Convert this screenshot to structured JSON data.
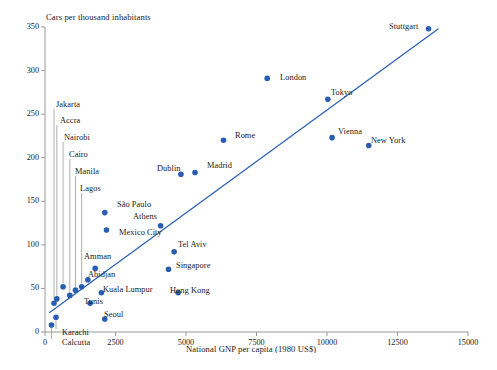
{
  "chart_data": {
    "type": "scatter",
    "title": "",
    "ylabel": "Cars per thousand inhabitants",
    "xlabel": "National GNP per capita (1980 US$)",
    "xlim": [
      0,
      15000
    ],
    "ylim": [
      0,
      350
    ],
    "xticks": [
      0,
      2500,
      5000,
      7500,
      10000,
      12500,
      15000
    ],
    "yticks": [
      0,
      50,
      100,
      150,
      200,
      250,
      300,
      350
    ],
    "grid": false,
    "legend": "none",
    "marker_color": "#2a5db0",
    "trendline_color": "#2a5db0",
    "axis_color": "#999999",
    "leader_color": "#999999",
    "trendline": {
      "x_start": 150,
      "y_start": 22,
      "x_end": 13950,
      "y_end": 348
    },
    "points": [
      {
        "city": "Calcutta",
        "x": 230,
        "y": 8,
        "label_pos": "leader-down",
        "label_x": 62,
        "label_y": 338
      },
      {
        "city": "Karachi",
        "x": 390,
        "y": 17,
        "label_pos": "leader-down",
        "label_x": 62,
        "label_y": 328
      },
      {
        "city": "Jakarta",
        "x": 320,
        "y": 33,
        "label_pos": "leader-up",
        "label_x": 56,
        "label_y": 100
      },
      {
        "city": "Accra",
        "x": 420,
        "y": 38,
        "label_pos": "leader-up",
        "label_x": 60,
        "label_y": 116
      },
      {
        "city": "Nairobi",
        "x": 640,
        "y": 52,
        "label_pos": "leader-up",
        "label_x": 64,
        "label_y": 133
      },
      {
        "city": "Cairo",
        "x": 880,
        "y": 42,
        "label_pos": "leader-up",
        "label_x": 69,
        "label_y": 150
      },
      {
        "city": "Manila",
        "x": 1080,
        "y": 48,
        "label_pos": "leader-up",
        "label_x": 75,
        "label_y": 167
      },
      {
        "city": "Lagos",
        "x": 1300,
        "y": 52,
        "label_pos": "leader-up",
        "label_x": 80,
        "label_y": 184
      },
      {
        "city": "Abidjan",
        "x": 1520,
        "y": 60,
        "label_pos": "right",
        "label_x": 88,
        "label_y": 270
      },
      {
        "city": "Amman",
        "x": 1780,
        "y": 73,
        "label_pos": "left",
        "label_x": 84,
        "label_y": 252
      },
      {
        "city": "Tunis",
        "x": 1600,
        "y": 33,
        "label_pos": "right",
        "label_x": 84,
        "label_y": 297
      },
      {
        "city": "Kuala Lumpur",
        "x": 2000,
        "y": 45,
        "label_pos": "right",
        "label_x": 103,
        "label_y": 285
      },
      {
        "city": "Seoul",
        "x": 2120,
        "y": 15,
        "label_pos": "right",
        "label_x": 104,
        "label_y": 310
      },
      {
        "city": "Mexico City",
        "x": 2180,
        "y": 117,
        "label_pos": "below",
        "label_x": 119,
        "label_y": 228
      },
      {
        "city": "São Paulo",
        "x": 2120,
        "y": 137,
        "label_pos": "right",
        "label_x": 117,
        "label_y": 200
      },
      {
        "city": "Athens",
        "x": 4100,
        "y": 122,
        "label_pos": "left",
        "label_x": 133,
        "label_y": 212
      },
      {
        "city": "Tel Aviv",
        "x": 4580,
        "y": 92,
        "label_pos": "right",
        "label_x": 178,
        "label_y": 240
      },
      {
        "city": "Singapore",
        "x": 4380,
        "y": 72,
        "label_pos": "right",
        "label_x": 176,
        "label_y": 261
      },
      {
        "city": "Hong Kong",
        "x": 4720,
        "y": 45,
        "label_pos": "right",
        "label_x": 170,
        "label_y": 286
      },
      {
        "city": "Dublin",
        "x": 4820,
        "y": 181,
        "label_pos": "left",
        "label_x": 157,
        "label_y": 164
      },
      {
        "city": "Madrid",
        "x": 5320,
        "y": 183,
        "label_pos": "right",
        "label_x": 207,
        "label_y": 161
      },
      {
        "city": "Rome",
        "x": 6330,
        "y": 220,
        "label_pos": "right",
        "label_x": 235,
        "label_y": 131
      },
      {
        "city": "London",
        "x": 7880,
        "y": 291,
        "label_pos": "above",
        "label_x": 280,
        "label_y": 73
      },
      {
        "city": "Tokyo",
        "x": 10030,
        "y": 267,
        "label_pos": "above",
        "label_x": 331,
        "label_y": 88
      },
      {
        "city": "Vienna",
        "x": 10180,
        "y": 223,
        "label_pos": "right",
        "label_x": 338,
        "label_y": 127
      },
      {
        "city": "New York",
        "x": 11480,
        "y": 214,
        "label_pos": "right",
        "label_x": 371,
        "label_y": 136
      },
      {
        "city": "Stuttgart",
        "x": 13600,
        "y": 348,
        "label_pos": "left",
        "label_x": 389,
        "label_y": 22
      }
    ]
  },
  "axes": {
    "y_title": "Cars per thousand inhabitants",
    "x_title": "National GNP per capita (1980 US$)",
    "y_tick_labels": [
      "0",
      "50",
      "100",
      "150",
      "200",
      "250",
      "300",
      "350"
    ],
    "x_tick_labels": [
      "0",
      "2500",
      "5000",
      "7500",
      "10000",
      "12500",
      "15000"
    ]
  }
}
